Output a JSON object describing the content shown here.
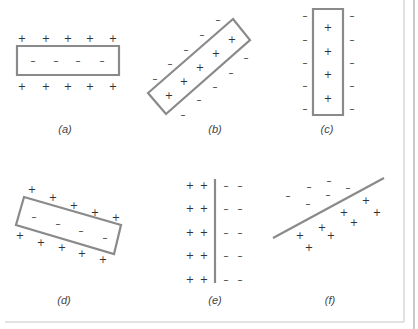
{
  "colors": {
    "shape_stroke": "#8a8a8a",
    "sign": "#333333",
    "label": "#444444",
    "frame": "#e2e2e2"
  },
  "panels": [
    {
      "id": "a",
      "label": "(a)",
      "label_pos": [
        65,
        129
      ],
      "shape": {
        "type": "polygon",
        "points": "17,46 119,46 119,75 17,75"
      },
      "plus": [
        [
          22,
          38
        ],
        [
          46,
          38
        ],
        [
          68,
          38
        ],
        [
          90,
          38
        ],
        [
          113,
          38
        ],
        [
          22,
          86
        ],
        [
          46,
          86
        ],
        [
          68,
          86
        ],
        [
          90,
          86
        ],
        [
          113,
          86
        ]
      ],
      "minus": [
        [
          33,
          60
        ],
        [
          56,
          60
        ],
        [
          78,
          60
        ],
        [
          102,
          60
        ]
      ]
    },
    {
      "id": "b",
      "label": "(b)",
      "label_pos": [
        215,
        129
      ],
      "shape": {
        "type": "polygon",
        "points": "233,19 250,40 166,114 148,93"
      },
      "plus": [
        [
          169,
          95
        ],
        [
          184,
          81
        ],
        [
          200,
          67
        ],
        [
          216,
          53
        ],
        [
          232,
          39
        ]
      ],
      "minus": [
        [
          155,
          78
        ],
        [
          170,
          63
        ],
        [
          186,
          49
        ],
        [
          202,
          34
        ],
        [
          218,
          19
        ],
        [
          183,
          114
        ],
        [
          199,
          99
        ],
        [
          215,
          86
        ],
        [
          231,
          72
        ],
        [
          246,
          57
        ]
      ]
    },
    {
      "id": "c",
      "label": "(c)",
      "label_pos": [
        327,
        129
      ],
      "shape": {
        "type": "polygon",
        "points": "313,9 343,9 343,115 313,115"
      },
      "plus": [
        [
          328,
          27
        ],
        [
          328,
          51
        ],
        [
          328,
          74
        ],
        [
          328,
          98
        ]
      ],
      "minus": [
        [
          305,
          15
        ],
        [
          305,
          39
        ],
        [
          305,
          62
        ],
        [
          305,
          85
        ],
        [
          305,
          108
        ],
        [
          352,
          15
        ],
        [
          352,
          39
        ],
        [
          352,
          62
        ],
        [
          352,
          85
        ],
        [
          352,
          108
        ]
      ]
    },
    {
      "id": "d",
      "label": "(d)",
      "label_pos": [
        64,
        300
      ],
      "shape": {
        "type": "polygon",
        "points": "24,197 121,225 114,254 16,225"
      },
      "plus": [
        [
          32,
          189
        ],
        [
          53,
          197
        ],
        [
          74,
          205
        ],
        [
          95,
          212
        ],
        [
          116,
          217
        ],
        [
          20,
          235
        ],
        [
          41,
          242
        ],
        [
          62,
          247
        ],
        [
          82,
          253
        ],
        [
          103,
          259
        ]
      ],
      "minus": [
        [
          34,
          216
        ],
        [
          58,
          223
        ],
        [
          81,
          230
        ],
        [
          105,
          237
        ]
      ]
    },
    {
      "id": "e",
      "label": "(e)",
      "label_pos": [
        215,
        300
      ],
      "shape": {
        "type": "line",
        "x1": 215,
        "y1": 179,
        "x2": 215,
        "y2": 283
      },
      "plus": [
        [
          190,
          185
        ],
        [
          204,
          185
        ],
        [
          190,
          208
        ],
        [
          204,
          208
        ],
        [
          190,
          232
        ],
        [
          204,
          232
        ],
        [
          190,
          255
        ],
        [
          204,
          255
        ],
        [
          190,
          279
        ],
        [
          204,
          279
        ]
      ],
      "minus": [
        [
          226,
          185
        ],
        [
          240,
          185
        ],
        [
          226,
          208
        ],
        [
          240,
          208
        ],
        [
          226,
          232
        ],
        [
          240,
          232
        ],
        [
          226,
          255
        ],
        [
          240,
          255
        ],
        [
          226,
          279
        ],
        [
          240,
          279
        ]
      ]
    },
    {
      "id": "f",
      "label": "(f)",
      "label_pos": [
        330,
        300
      ],
      "shape": {
        "type": "line",
        "x1": 273,
        "y1": 238,
        "x2": 384,
        "y2": 178
      },
      "plus": [
        [
          366,
          200
        ],
        [
          377,
          212
        ],
        [
          344,
          212
        ],
        [
          322,
          227
        ],
        [
          354,
          222
        ],
        [
          300,
          235
        ],
        [
          331,
          235
        ],
        [
          309,
          247
        ]
      ],
      "minus": [
        [
          288,
          195
        ],
        [
          309,
          186
        ],
        [
          329,
          180
        ],
        [
          348,
          187
        ],
        [
          308,
          203
        ],
        [
          328,
          194
        ]
      ]
    }
  ],
  "symbols": {
    "plus": "+",
    "minus": "–"
  }
}
